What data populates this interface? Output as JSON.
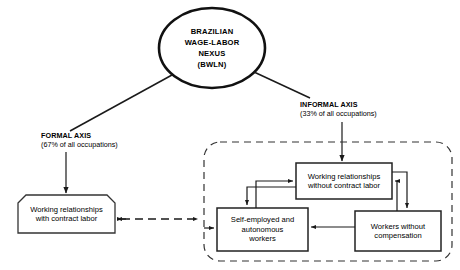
{
  "diagram": {
    "hub": {
      "label": "BRAZILIAN\nWAGE-LABOR\nNEXUS\n(BWLN)"
    },
    "axes": [
      {
        "title": "FORMAL AXIS",
        "subtitle": "(67% of all occupations)"
      },
      {
        "title": "INFORMAL AXIS",
        "subtitle": "(33% of all occupations)"
      }
    ],
    "nodes": {
      "formal_box": "Working relationships\nwith contract labor",
      "informal_top": "Working relationships\nwithout contract labor",
      "informal_left": "Self-employed and\nautonomous\nworkers",
      "informal_right": "Workers without\ncompensation"
    },
    "colors": {
      "stroke": "#1a1a1a",
      "background": "#ffffff",
      "text": "#000000"
    }
  }
}
